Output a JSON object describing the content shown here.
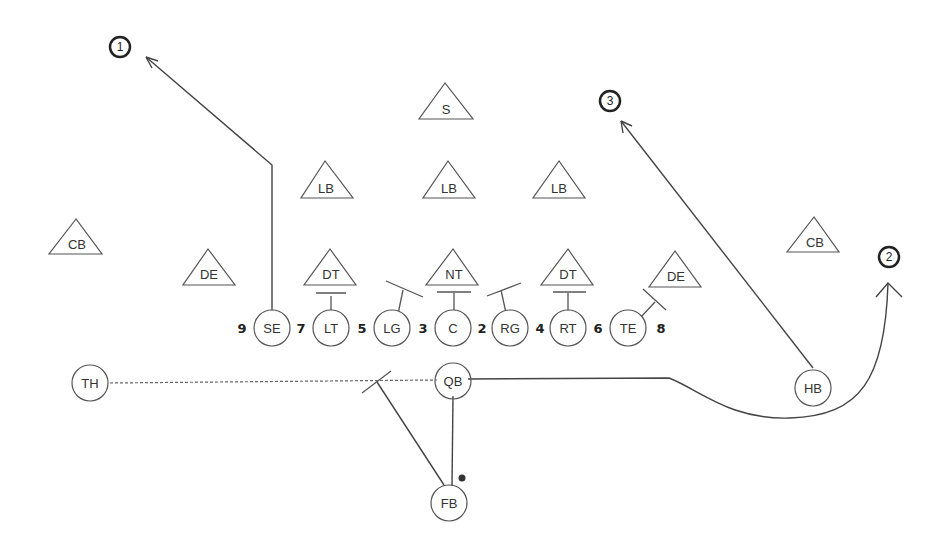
{
  "diagram": {
    "defense": [
      {
        "id": "S",
        "label": "S",
        "x": 445,
        "y": 100
      },
      {
        "id": "LB-left",
        "label": "LB",
        "x": 325,
        "y": 180
      },
      {
        "id": "LB-mid",
        "label": "LB",
        "x": 448,
        "y": 180
      },
      {
        "id": "LB-right",
        "label": "LB",
        "x": 558,
        "y": 180
      },
      {
        "id": "CB-left",
        "label": "CB",
        "x": 76,
        "y": 240
      },
      {
        "id": "DE-left",
        "label": "DE",
        "x": 208,
        "y": 268
      },
      {
        "id": "DT-left",
        "label": "DT",
        "x": 330,
        "y": 268
      },
      {
        "id": "NT",
        "label": "NT",
        "x": 454,
        "y": 268
      },
      {
        "id": "DT-right",
        "label": "DT",
        "x": 568,
        "y": 268
      },
      {
        "id": "DE-right",
        "label": "DE",
        "x": 676,
        "y": 272
      },
      {
        "id": "CB-right",
        "label": "CB",
        "x": 814,
        "y": 236
      }
    ],
    "offense": [
      {
        "id": "SE",
        "label": "SE",
        "x": 272,
        "y": 328
      },
      {
        "id": "LT",
        "label": "LT",
        "x": 331,
        "y": 328
      },
      {
        "id": "LG",
        "label": "LG",
        "x": 392,
        "y": 328
      },
      {
        "id": "C",
        "label": "C",
        "x": 453,
        "y": 328
      },
      {
        "id": "RG",
        "label": "RG",
        "x": 510,
        "y": 328
      },
      {
        "id": "RT",
        "label": "RT",
        "x": 568,
        "y": 328
      },
      {
        "id": "TE",
        "label": "TE",
        "x": 628,
        "y": 328
      },
      {
        "id": "TH",
        "label": "TH",
        "x": 90,
        "y": 383
      },
      {
        "id": "QB",
        "label": "QB",
        "x": 453,
        "y": 381
      },
      {
        "id": "HB",
        "label": "HB",
        "x": 813,
        "y": 388
      },
      {
        "id": "FB",
        "label": "FB",
        "x": 449,
        "y": 503
      }
    ],
    "gap_numbers": [
      {
        "label": "9",
        "x": 242,
        "y": 333
      },
      {
        "label": "7",
        "x": 301,
        "y": 333
      },
      {
        "label": "5",
        "x": 362,
        "y": 333
      },
      {
        "label": "3",
        "x": 423,
        "y": 333
      },
      {
        "label": "2",
        "x": 482,
        "y": 333
      },
      {
        "label": "4",
        "x": 540,
        "y": 333
      },
      {
        "label": "6",
        "x": 598,
        "y": 333
      },
      {
        "label": "8",
        "x": 661,
        "y": 333
      }
    ],
    "read_targets": [
      {
        "label": "1",
        "x": 120,
        "y": 47
      },
      {
        "label": "3",
        "x": 610,
        "y": 101
      },
      {
        "label": "2",
        "x": 889,
        "y": 257
      }
    ],
    "colors": {
      "line": "#444444",
      "shape_stroke": "#555555",
      "target_stroke": "#222222",
      "background": "#ffffff"
    }
  }
}
